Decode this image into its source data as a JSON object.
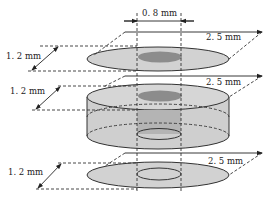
{
  "diagram": {
    "title": "",
    "labels": {
      "hole_diameter": "0. 8 mm",
      "top_layer_thickness": "1. 2 mm",
      "middle_layer_thickness": "1. 2 mm",
      "bottom_layer_thickness": "1. 2 mm",
      "top_layer_diameter": "2. 5 mm",
      "middle_layer_diameter": "2. 5 mm",
      "bottom_layer_diameter": "2. 5 mm"
    },
    "layers": [
      {
        "name": "top-disk",
        "diameter_mm": 2.5,
        "thickness_mm": 1.2,
        "hole_diameter_mm": 0.8
      },
      {
        "name": "middle-cylinder",
        "diameter_mm": 2.5,
        "thickness_mm": 1.2,
        "hole_diameter_mm": 0.8
      },
      {
        "name": "bottom-disk",
        "diameter_mm": 2.5,
        "thickness_mm": 1.2,
        "hole_diameter_mm": 0.8
      }
    ],
    "colors": {
      "disk_fill": "#d2d2d2",
      "hole_fill": "#8c8c8c",
      "cylinder_side": "#cfcfcf",
      "line": "#222222"
    }
  }
}
